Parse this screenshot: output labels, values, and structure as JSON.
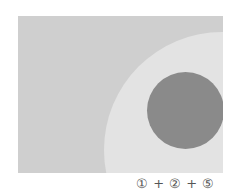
{
  "diagram": {
    "background_color": "#cfcfcf",
    "outer_circle_color": "#e3e3e3",
    "inner_circle_color": "#8a8a8a",
    "caption": "① + ② + ⑤"
  }
}
